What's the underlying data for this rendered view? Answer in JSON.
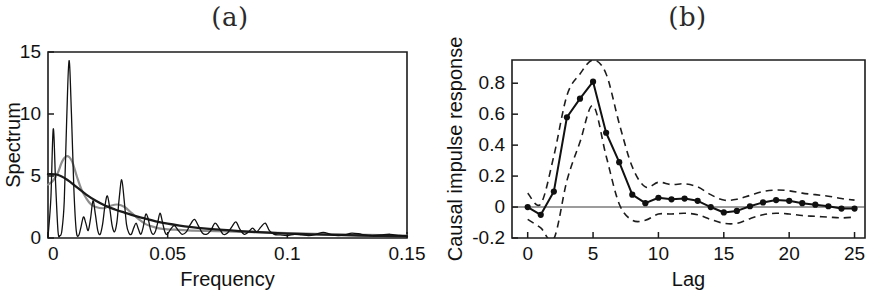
{
  "figure": {
    "panels": [
      {
        "id": "a",
        "label": "(a)"
      },
      {
        "id": "b",
        "label": "(b)"
      }
    ]
  },
  "panel_a": {
    "title": "(a)",
    "ylabel": "Spectrum",
    "xlabel": "Frequency",
    "xticks": [
      "0",
      "0.05",
      "0.1",
      "0.15"
    ],
    "yticks": [
      "0",
      "5",
      "10",
      "15"
    ]
  },
  "panel_b": {
    "title": "(b)",
    "ylabel": "Causal impulse response",
    "xlabel": "Lag",
    "xticks": [
      "0",
      "5",
      "10",
      "15",
      "20",
      "25"
    ],
    "yticks": [
      "-0.2",
      "0",
      "0.2",
      "0.4",
      "0.6",
      "0.8"
    ]
  },
  "chart_data": [
    {
      "type": "line",
      "id": "panel-a-spectrum",
      "title": "(a)",
      "xlabel": "Frequency",
      "ylabel": "Spectrum",
      "xlim": [
        0,
        0.15
      ],
      "ylim": [
        0,
        15
      ],
      "xticks": [
        0,
        0.05,
        0.1,
        0.15
      ],
      "yticks": [
        0,
        5,
        10,
        15
      ],
      "grid": false,
      "legend": "none",
      "series": [
        {
          "name": "periodogram",
          "color": "#111111",
          "style": "solid",
          "width": "thin",
          "x": [
            0,
            0.0012,
            0.0022,
            0.0032,
            0.0042,
            0.005,
            0.0058,
            0.0068,
            0.0078,
            0.0088,
            0.0098,
            0.0108,
            0.0118,
            0.0128,
            0.0138,
            0.0148,
            0.0158,
            0.0168,
            0.0178,
            0.0188,
            0.0198,
            0.0208,
            0.0218,
            0.0228,
            0.0238,
            0.0248,
            0.0258,
            0.0268,
            0.0278,
            0.0288,
            0.0298,
            0.0308,
            0.0318,
            0.0328,
            0.0338,
            0.0348,
            0.0358,
            0.0368,
            0.0378,
            0.0388,
            0.0398,
            0.0408,
            0.0418,
            0.0428,
            0.0438,
            0.0448,
            0.0458,
            0.0468,
            0.0478,
            0.0488,
            0.0498,
            0.0512,
            0.0528,
            0.0545,
            0.056,
            0.0578,
            0.0595,
            0.0612,
            0.0628,
            0.0645,
            0.0662,
            0.068,
            0.0698,
            0.0715,
            0.0732,
            0.075,
            0.0768,
            0.0785,
            0.0802,
            0.082,
            0.0838,
            0.0855,
            0.0872,
            0.089,
            0.0908,
            0.0925,
            0.0945,
            0.097,
            0.1,
            0.103,
            0.106,
            0.109,
            0.112,
            0.115,
            0.118,
            0.121,
            0.124,
            0.127,
            0.131,
            0.135,
            0.139,
            0.143,
            0.147,
            0.15
          ],
          "y": [
            0.1,
            3.2,
            8.8,
            4.3,
            0.5,
            0.2,
            0.6,
            3.0,
            9.5,
            14.3,
            10.0,
            4.0,
            0.6,
            0.2,
            0.9,
            1.7,
            1.2,
            0.6,
            1.6,
            3.0,
            1.9,
            0.6,
            0.3,
            1.1,
            2.6,
            3.4,
            2.4,
            1.0,
            0.5,
            1.3,
            3.3,
            4.7,
            3.1,
            1.1,
            0.4,
            0.3,
            0.8,
            1.2,
            0.7,
            0.3,
            0.9,
            1.9,
            1.6,
            0.7,
            0.3,
            0.5,
            1.2,
            2.0,
            1.3,
            0.5,
            0.3,
            0.7,
            1.0,
            0.6,
            0.3,
            0.5,
            1.1,
            1.5,
            1.0,
            0.4,
            0.3,
            0.6,
            1.2,
            0.8,
            0.3,
            0.4,
            0.9,
            1.3,
            0.7,
            0.3,
            0.5,
            0.8,
            0.5,
            0.9,
            1.2,
            0.6,
            0.3,
            0.25,
            0.2,
            0.3,
            0.25,
            0.2,
            0.3,
            0.45,
            0.3,
            0.2,
            0.25,
            0.4,
            0.3,
            0.2,
            0.25,
            0.3,
            0.2,
            0.15
          ]
        },
        {
          "name": "smoothed-spectrum",
          "color": "#8e8e8e",
          "style": "solid",
          "width": "medium",
          "x": [
            0,
            0.002,
            0.004,
            0.006,
            0.008,
            0.01,
            0.012,
            0.014,
            0.016,
            0.018,
            0.02,
            0.023,
            0.026,
            0.029,
            0.032,
            0.035,
            0.038,
            0.041,
            0.044,
            0.047,
            0.05,
            0.055,
            0.06,
            0.07,
            0.08,
            0.09,
            0.1,
            0.12,
            0.15
          ],
          "y": [
            4.3,
            4.6,
            5.2,
            6.2,
            6.6,
            6.2,
            5.0,
            3.9,
            3.2,
            2.7,
            2.5,
            2.4,
            2.6,
            2.7,
            2.5,
            2.0,
            1.5,
            1.1,
            0.9,
            0.75,
            0.7,
            0.65,
            0.6,
            0.55,
            0.5,
            0.45,
            0.4,
            0.3,
            0.2
          ]
        },
        {
          "name": "parametric-spectrum",
          "color": "#1b1b1b",
          "style": "solid",
          "width": "medium",
          "x": [
            0,
            0.004,
            0.008,
            0.012,
            0.016,
            0.02,
            0.024,
            0.028,
            0.032,
            0.036,
            0.04,
            0.045,
            0.05,
            0.055,
            0.06,
            0.065,
            0.07,
            0.08,
            0.09,
            0.1,
            0.11,
            0.12,
            0.13,
            0.14,
            0.15
          ],
          "y": [
            5.15,
            5.1,
            4.7,
            4.1,
            3.5,
            3.0,
            2.6,
            2.3,
            2.05,
            1.8,
            1.6,
            1.35,
            1.15,
            1.0,
            0.88,
            0.78,
            0.7,
            0.56,
            0.45,
            0.36,
            0.3,
            0.25,
            0.2,
            0.17,
            0.14
          ]
        }
      ]
    },
    {
      "type": "line",
      "id": "panel-b-causal-impulse-response",
      "title": "(b)",
      "xlabel": "Lag",
      "ylabel": "Causal impulse response",
      "xlim": [
        -1.2,
        25.8
      ],
      "ylim": [
        -0.2,
        0.95
      ],
      "xticks": [
        0,
        5,
        10,
        15,
        20,
        25
      ],
      "yticks": [
        -0.2,
        0,
        0.2,
        0.4,
        0.6,
        0.8
      ],
      "grid": false,
      "legend": "none",
      "zero_line": 0,
      "x": [
        0,
        1,
        2,
        3,
        4,
        5,
        6,
        7,
        8,
        9,
        10,
        11,
        12,
        13,
        14,
        15,
        16,
        17,
        18,
        19,
        20,
        21,
        22,
        23,
        24,
        25
      ],
      "series": [
        {
          "name": "estimate",
          "color": "#111111",
          "style": "solid",
          "markers": true,
          "values": [
            0.0,
            -0.05,
            0.1,
            0.58,
            0.7,
            0.81,
            0.48,
            0.29,
            0.08,
            0.025,
            0.06,
            0.05,
            0.055,
            0.04,
            0.0,
            -0.035,
            -0.025,
            0.005,
            0.03,
            0.045,
            0.04,
            0.025,
            0.015,
            0.005,
            -0.01,
            -0.01
          ]
        },
        {
          "name": "upper-confidence-bound",
          "color": "#1d1d1d",
          "style": "dashed",
          "markers": false,
          "values": [
            0.09,
            0.02,
            0.33,
            0.72,
            0.86,
            0.95,
            0.86,
            0.54,
            0.26,
            0.13,
            0.16,
            0.145,
            0.15,
            0.13,
            0.08,
            0.045,
            0.05,
            0.075,
            0.1,
            0.11,
            0.105,
            0.09,
            0.08,
            0.07,
            0.055,
            0.045
          ]
        },
        {
          "name": "lower-confidence-bound",
          "color": "#1d1d1d",
          "style": "dashed",
          "markers": false,
          "values": [
            -0.08,
            -0.135,
            -0.205,
            0.17,
            0.42,
            0.655,
            0.33,
            0.02,
            -0.085,
            -0.085,
            -0.045,
            -0.045,
            -0.04,
            -0.05,
            -0.08,
            -0.105,
            -0.105,
            -0.075,
            -0.05,
            -0.04,
            -0.045,
            -0.055,
            -0.06,
            -0.065,
            -0.07,
            -0.065
          ]
        }
      ]
    }
  ]
}
